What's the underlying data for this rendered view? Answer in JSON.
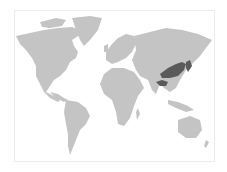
{
  "map": {
    "type": "world-locator-map",
    "land_color": "#c4c4c4",
    "highlight_color": "#5a5a5a",
    "frame_color": "#ececec",
    "highlighted_regions": [
      "central-east-china",
      "korea",
      "japan",
      "himalaya-north-india-band"
    ]
  }
}
